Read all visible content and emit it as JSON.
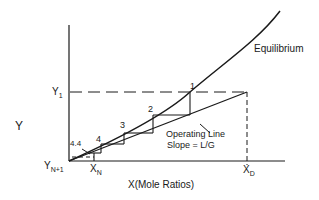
{
  "diagram": {
    "y_axis_label": "Y",
    "x_axis_label": "X(Mole Ratios)",
    "curve_label": "Equilibrium",
    "operating_line_label_1": "Operating Line",
    "operating_line_label_2": "Slope = L/G",
    "y1_label": "Y",
    "y1_sub": "1",
    "yn1_label": "Y",
    "yn1_sub": "N+1",
    "xn_label": "X",
    "xn_sub": "N",
    "xd_label": "X",
    "xd_sub": "D",
    "stage_labels": [
      "1",
      "2",
      "3",
      "4",
      "4.4"
    ],
    "line_color": "#1a1a1a"
  }
}
